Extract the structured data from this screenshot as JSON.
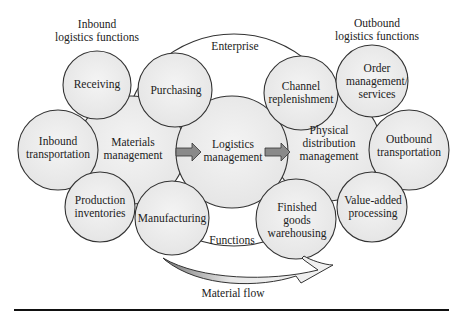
{
  "headers": {
    "inbound": [
      "Inbound",
      "logistics functions"
    ],
    "outbound": [
      "Outbound",
      "logistics functions"
    ]
  },
  "enterprise_label": "Enterprise",
  "functions_label": "Functions",
  "material_flow_label": "Material flow",
  "nodes": {
    "receiving": [
      "Receiving"
    ],
    "purchasing": [
      "Purchasing"
    ],
    "channel_replenishment": [
      "Channel",
      "replenishment"
    ],
    "order_management": [
      "Order",
      "management/",
      "services"
    ],
    "inbound_transportation": [
      "Inbound",
      "transportation"
    ],
    "materials_management": [
      "Materials",
      "management"
    ],
    "logistics_management": [
      "Logistics",
      "management"
    ],
    "physical_distribution": [
      "Physical",
      "distribution",
      "management"
    ],
    "outbound_transportation": [
      "Outbound",
      "transportation"
    ],
    "production_inventories": [
      "Production",
      "inventories"
    ],
    "manufacturing": [
      "Manufacturing"
    ],
    "finished_goods": [
      "Finished",
      "goods",
      "warehousing"
    ],
    "value_added": [
      "Value-added",
      "processing"
    ]
  },
  "colors": {
    "circle_fill": "#ebebeb",
    "circle_stroke": "#333333",
    "arrow_fill": "#8a8a8a",
    "flow_arrow_fill": "#e6e6e6",
    "rule": "#111111"
  }
}
